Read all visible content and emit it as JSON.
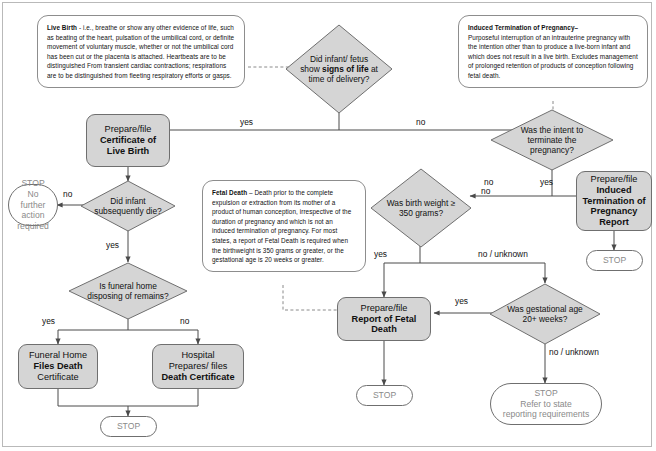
{
  "diagram": {
    "type": "flowchart",
    "colors": {
      "process_fill": "#d5d5d5",
      "decision_fill": "#d5d5d5",
      "terminator_fill": "#ffffff",
      "shape_stroke": "#6f6f6f",
      "connector": "#4a4a4a",
      "note_stroke": "#8d8d8d",
      "terminator_text": "#8a8a8a",
      "background": "#ffffff"
    }
  },
  "notes": {
    "live_birth": {
      "term": "Live Birth",
      "body": " - i.e., breathe or show any other evidence of life, such as beating of the heart, pulsation of the umbilical cord, or definite movement of voluntary muscle, whether or not the umbilical cord has been cut or the placenta is attached. Heartbeats are to be distinguished From transient cardiac contractions; respirations are to be distinguished from fleeting respiratory efforts or gasps."
    },
    "itop": {
      "term": "Induced Termination of Pregnancy–",
      "body": "Purposeful interruption of an intrauterine pregnancy with the intention other than to produce a live-born infant and which does not result in a live birth.  Excludes management of prolonged retention of products of conception following fetal death."
    },
    "fetal_death": {
      "term": "Fetal Death",
      "body": " –  Death prior to the complete expulsion or extraction from its mother of a product of human conception, irrespective of the duration of pregnancy and which is not an induced termination of pregnancy. For most states, a report of Fetal Death is required when the birthweight is 350 grams or greater, or the gestational age is 20 weeks or greater."
    }
  },
  "decisions": {
    "signs_of_life": {
      "pre": "Did infant/ fetus show ",
      "em": "signs of life",
      "post": " at time of delivery?"
    },
    "subsequent_death": {
      "text": "Did infant subsequently die?"
    },
    "funeral_home": {
      "text": "Is funeral home disposing of remains?"
    },
    "intent_terminate": {
      "text": "Was the intent to terminate the pregnancy?"
    },
    "birth_weight": {
      "text": "Was birth weight ≥ 350 grams?"
    },
    "gestational_age": {
      "text": "Was gestational age 20+ weeks?"
    }
  },
  "processes": {
    "certificate_live_birth": {
      "line1": "Prepare/file",
      "line2": "Certificate of Live Birth"
    },
    "itop_report": {
      "line1": "Prepare/file",
      "line2": "Induced Termination of Pregnancy Report"
    },
    "fetal_death_report": {
      "line1": "Prepare/file",
      "line2": "Report of Fetal Death"
    },
    "funeral_home_files": {
      "line1": "Funeral Home",
      "line2": "Files Death",
      "line3": "Certificate"
    },
    "hospital_prepares": {
      "line1": "Hospital",
      "line2": "Prepares/ files",
      "line3": "Death Certificate"
    }
  },
  "terminators": {
    "stop_no_action": {
      "line1": "STOP",
      "line2": "No further",
      "line3": "action required"
    },
    "stop_itop": {
      "line1": "STOP"
    },
    "stop_death_cert": {
      "line1": "STOP"
    },
    "stop_fetal_death": {
      "line1": "STOP"
    },
    "stop_refer_state": {
      "line1": "STOP",
      "line2": "Refer to state",
      "line3": "reporting requirements"
    }
  },
  "edge_labels": {
    "life_yes": "yes",
    "life_no": "no",
    "subseq_no": "no",
    "subseq_yes": "yes",
    "funeral_yes": "yes",
    "funeral_no": "no",
    "intent_no": "no",
    "intent_yes": "yes",
    "weight_yes": "yes",
    "weight_no": "no",
    "weight_no_unknown": "no / unknown",
    "gest_yes": "yes",
    "gest_no_unknown": "no / unknown"
  }
}
